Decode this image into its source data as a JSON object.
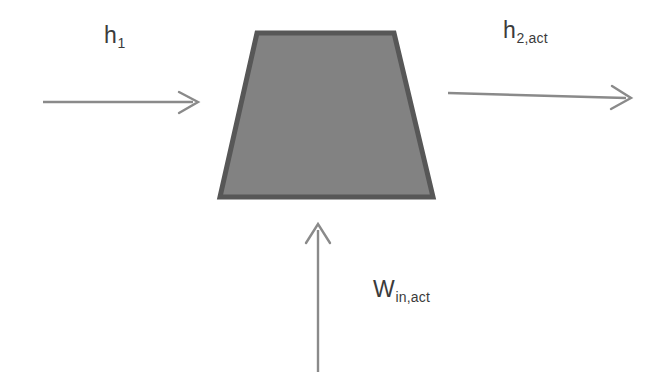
{
  "diagram": {
    "type": "thermodynamic-control-volume",
    "device": {
      "name": "compressor",
      "shape": "trapezoid",
      "fill_color": "#828282",
      "border_color": "#575757",
      "geometry": {
        "top_left_x": 257,
        "top_right_x": 394,
        "bottom_left_x": 220,
        "bottom_right_x": 433,
        "top_y": 33,
        "bottom_y": 197
      }
    },
    "arrow_color": "#8a8a8a",
    "flows": [
      {
        "id": "inlet",
        "direction": "right",
        "label_base": "h",
        "label_sub": "1",
        "label_full": "h1",
        "x1": 43,
        "y1": 102,
        "x2": 198,
        "y2": 102
      },
      {
        "id": "outlet",
        "direction": "right",
        "label_base": "h",
        "label_sub": "2,act",
        "label_full": "h2,act",
        "x1": 448,
        "y1": 93,
        "x2": 631,
        "y2": 98
      },
      {
        "id": "work-input",
        "direction": "up",
        "label_base": "W",
        "label_sub": "in,act",
        "label_full": "Win,act",
        "x1": 318,
        "y1": 372,
        "x2": 318,
        "y2": 225
      }
    ]
  }
}
